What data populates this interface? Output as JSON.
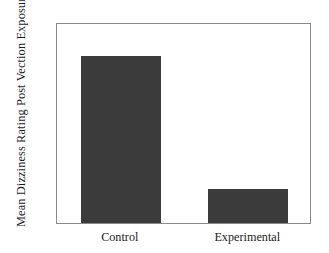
{
  "chart_data": {
    "type": "bar",
    "title": "",
    "xlabel": "",
    "ylabel": "Mean Dizziness Rating Post Vection Exposure",
    "categories": [
      "Control",
      "Experimental"
    ],
    "values": [
      3.9,
      1.6
    ],
    "ylim": [
      1.0,
      4.5
    ],
    "yticks": [
      "1.0",
      "1.5",
      "2.0",
      "2.5",
      "3.0",
      "3.5",
      "4.0",
      "4.5"
    ],
    "ytick_values": [
      1.0,
      1.5,
      2.0,
      2.5,
      3.0,
      3.5,
      4.0,
      4.5
    ],
    "grid": false,
    "legend": false,
    "legend_position": "none",
    "bar_color": "#3b3b3b",
    "frame_color": "#8a8a8a",
    "background_color": "#ffffff"
  }
}
